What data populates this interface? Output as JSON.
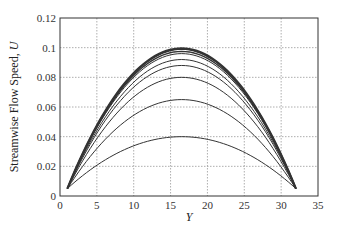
{
  "chart_data": {
    "type": "line",
    "title": "",
    "xlabel": "Y",
    "ylabel": "Streamwise Flow Speed, U",
    "xlim": [
      0,
      35
    ],
    "ylim": [
      0,
      0.12
    ],
    "xticks": [
      0,
      5,
      10,
      15,
      20,
      25,
      30,
      35
    ],
    "yticks": [
      0,
      0.02,
      0.04,
      0.06,
      0.08,
      0.1,
      0.12
    ],
    "xtick_labels": [
      "0",
      "5",
      "10",
      "15",
      "20",
      "25",
      "30",
      "35"
    ],
    "ytick_labels": [
      "0",
      "0.02",
      "0.04",
      "0.06",
      "0.08",
      "0.1",
      "0.12"
    ],
    "grid": true,
    "legend": null,
    "x_start": 1,
    "x_end": 32,
    "x_peak": 16.5,
    "edge_value": 0.005,
    "series": [
      {
        "name": "profile 1",
        "peak": 0.04,
        "x": [
          1,
          5,
          10,
          16.5,
          23,
          28,
          32
        ],
        "values": [
          0.005,
          0.022,
          0.035,
          0.04,
          0.035,
          0.022,
          0.005
        ]
      },
      {
        "name": "profile 2",
        "peak": 0.065,
        "x": [
          1,
          5,
          10,
          16.5,
          23,
          28,
          32
        ],
        "values": [
          0.005,
          0.034,
          0.054,
          0.065,
          0.054,
          0.034,
          0.005
        ]
      },
      {
        "name": "profile 3",
        "peak": 0.08,
        "x": [
          1,
          5,
          10,
          16.5,
          23,
          28,
          32
        ],
        "values": [
          0.005,
          0.041,
          0.066,
          0.08,
          0.066,
          0.041,
          0.005
        ]
      },
      {
        "name": "profile 4",
        "peak": 0.088,
        "x": [
          1,
          5,
          10,
          16.5,
          23,
          28,
          32
        ],
        "values": [
          0.005,
          0.045,
          0.072,
          0.088,
          0.072,
          0.045,
          0.005
        ]
      },
      {
        "name": "profile 5",
        "peak": 0.092,
        "x": [
          1,
          5,
          10,
          16.5,
          23,
          28,
          32
        ],
        "values": [
          0.005,
          0.047,
          0.075,
          0.092,
          0.075,
          0.047,
          0.005
        ]
      },
      {
        "name": "profile 6",
        "peak": 0.096,
        "x": [
          1,
          5,
          10,
          16.5,
          23,
          28,
          32
        ],
        "values": [
          0.005,
          0.049,
          0.078,
          0.096,
          0.078,
          0.049,
          0.005
        ]
      },
      {
        "name": "profile 7",
        "peak": 0.0975,
        "x": [
          1,
          5,
          10,
          16.5,
          23,
          28,
          32
        ],
        "values": [
          0.005,
          0.05,
          0.08,
          0.0975,
          0.08,
          0.05,
          0.005
        ]
      },
      {
        "name": "profile 8",
        "peak": 0.099,
        "x": [
          1,
          5,
          10,
          16.5,
          23,
          28,
          32
        ],
        "values": [
          0.005,
          0.051,
          0.081,
          0.099,
          0.081,
          0.051,
          0.005
        ]
      },
      {
        "name": "profile 9",
        "peak": 0.0995,
        "x": [
          1,
          5,
          10,
          16.5,
          23,
          28,
          32
        ],
        "values": [
          0.005,
          0.051,
          0.081,
          0.0995,
          0.081,
          0.051,
          0.005
        ]
      }
    ],
    "stroke_widths": [
      1,
      1,
      1,
      1,
      1,
      1,
      1.3,
      1.6,
      2.2
    ],
    "color": "#333333"
  }
}
